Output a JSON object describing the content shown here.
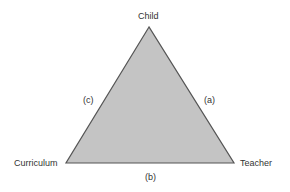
{
  "diagram": {
    "type": "triangle",
    "fill_color": "#c4c4c4",
    "stroke_color": "#555555",
    "vertices": {
      "top": "Child",
      "bottom_left": "Curriculum",
      "bottom_right": "Teacher"
    },
    "edges": {
      "right": "(a)",
      "bottom": "(b)",
      "left": "(c)"
    }
  }
}
